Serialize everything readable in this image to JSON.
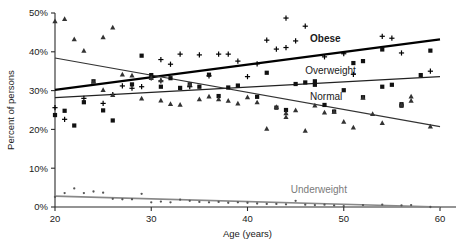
{
  "chart_data": {
    "type": "scatter",
    "title": "",
    "subtitle": "",
    "xlabel": "Age (years)",
    "ylabel": "Percent of persons",
    "xlim": [
      20,
      60
    ],
    "ylim": [
      0,
      50
    ],
    "xticks": [
      20,
      30,
      40,
      50,
      60
    ],
    "xtick_labels": [
      "20",
      "30",
      "40",
      "50",
      "60"
    ],
    "yticks": [
      0,
      10,
      20,
      30,
      40,
      50
    ],
    "ytick_labels": [
      "0%",
      "10%",
      "20%",
      "30%",
      "40%",
      "50%"
    ],
    "grid": false,
    "legend_position": "inline-annotations",
    "series": [
      {
        "name": "Obese",
        "label": "Obese",
        "marker": "plus",
        "color": "#000000",
        "line_color": "#000000",
        "line_width": 2.2,
        "label_x": 46.5,
        "label_y": 42.4,
        "trend": {
          "x": [
            20,
            60
          ],
          "y": [
            30.2,
            43.2
          ]
        },
        "points": [
          {
            "x": 20,
            "y": 25.6
          },
          {
            "x": 21,
            "y": 22.6
          },
          {
            "x": 23,
            "y": 28.0
          },
          {
            "x": 25,
            "y": 26.7
          },
          {
            "x": 26,
            "y": 29.0
          },
          {
            "x": 27,
            "y": 31.2
          },
          {
            "x": 28,
            "y": 30.6
          },
          {
            "x": 29,
            "y": 31.0
          },
          {
            "x": 30,
            "y": 33.3
          },
          {
            "x": 31,
            "y": 38.0
          },
          {
            "x": 31,
            "y": 32.5
          },
          {
            "x": 32,
            "y": 36.8
          },
          {
            "x": 33,
            "y": 39.4
          },
          {
            "x": 34,
            "y": 31.0
          },
          {
            "x": 35,
            "y": 39.2
          },
          {
            "x": 36,
            "y": 33.8
          },
          {
            "x": 37,
            "y": 39.4
          },
          {
            "x": 38,
            "y": 39.4
          },
          {
            "x": 39,
            "y": 37.6
          },
          {
            "x": 40,
            "y": 33.6
          },
          {
            "x": 41,
            "y": 36.9
          },
          {
            "x": 42,
            "y": 43.0
          },
          {
            "x": 43,
            "y": 40.7
          },
          {
            "x": 44,
            "y": 48.7
          },
          {
            "x": 44,
            "y": 41.1
          },
          {
            "x": 45,
            "y": 42.8
          },
          {
            "x": 46,
            "y": 46.6
          },
          {
            "x": 48,
            "y": 38.7
          },
          {
            "x": 50,
            "y": 39.5
          },
          {
            "x": 51,
            "y": 34.2
          },
          {
            "x": 54,
            "y": 44.0
          },
          {
            "x": 55,
            "y": 43.5
          },
          {
            "x": 56,
            "y": 39.7
          },
          {
            "x": 59,
            "y": 35.0
          }
        ]
      },
      {
        "name": "Overweight",
        "label": "Overweight",
        "marker": "square",
        "color": "#111111",
        "line_color": "#222222",
        "line_width": 1.4,
        "label_x": 46.0,
        "label_y": 34.3,
        "trend": {
          "x": [
            20,
            60
          ],
          "y": [
            28.2,
            33.6
          ]
        },
        "points": [
          {
            "x": 20,
            "y": 23.7
          },
          {
            "x": 21,
            "y": 24.8
          },
          {
            "x": 22,
            "y": 21.0
          },
          {
            "x": 23,
            "y": 27.0
          },
          {
            "x": 24,
            "y": 32.4
          },
          {
            "x": 25,
            "y": 24.9
          },
          {
            "x": 26,
            "y": 22.3
          },
          {
            "x": 28,
            "y": 31.6
          },
          {
            "x": 29,
            "y": 39.0
          },
          {
            "x": 30,
            "y": 34.0
          },
          {
            "x": 31,
            "y": 31.0
          },
          {
            "x": 32,
            "y": 33.2
          },
          {
            "x": 33,
            "y": 30.7
          },
          {
            "x": 34,
            "y": 31.6
          },
          {
            "x": 35,
            "y": 31.0
          },
          {
            "x": 36,
            "y": 34.1
          },
          {
            "x": 37,
            "y": 28.6
          },
          {
            "x": 38,
            "y": 30.8
          },
          {
            "x": 39,
            "y": 31.3
          },
          {
            "x": 41,
            "y": 28.4
          },
          {
            "x": 42,
            "y": 34.6
          },
          {
            "x": 43,
            "y": 25.6
          },
          {
            "x": 44,
            "y": 25.0
          },
          {
            "x": 45,
            "y": 31.7
          },
          {
            "x": 46,
            "y": 32.1
          },
          {
            "x": 47,
            "y": 32.4
          },
          {
            "x": 47,
            "y": 31.5
          },
          {
            "x": 48,
            "y": 26.3
          },
          {
            "x": 49,
            "y": 24.6
          },
          {
            "x": 50,
            "y": 30.1
          },
          {
            "x": 51,
            "y": 37.1
          },
          {
            "x": 52,
            "y": 28.3
          },
          {
            "x": 52,
            "y": 37.6
          },
          {
            "x": 54,
            "y": 40.6
          },
          {
            "x": 54,
            "y": 31.0
          },
          {
            "x": 55,
            "y": 31.5
          },
          {
            "x": 56,
            "y": 26.5
          },
          {
            "x": 56,
            "y": 26.1
          },
          {
            "x": 58,
            "y": 34.0
          },
          {
            "x": 59,
            "y": 40.3
          }
        ]
      },
      {
        "name": "Normal",
        "label": "Normal",
        "marker": "triangle",
        "color": "#333333",
        "line_color": "#333333",
        "line_width": 1.2,
        "label_x": 46.5,
        "label_y": 27.5,
        "trend": {
          "x": [
            20,
            60
          ],
          "y": [
            38.4,
            20.7
          ]
        },
        "points": [
          {
            "x": 20,
            "y": 47.9
          },
          {
            "x": 21,
            "y": 48.5
          },
          {
            "x": 22,
            "y": 43.3
          },
          {
            "x": 23,
            "y": 40.3
          },
          {
            "x": 24,
            "y": 32.3
          },
          {
            "x": 25,
            "y": 43.8
          },
          {
            "x": 25,
            "y": 30.2
          },
          {
            "x": 26,
            "y": 46.3
          },
          {
            "x": 26,
            "y": 28.9
          },
          {
            "x": 27,
            "y": 34.2
          },
          {
            "x": 28,
            "y": 33.9
          },
          {
            "x": 29,
            "y": 28.0
          },
          {
            "x": 30,
            "y": 33.3
          },
          {
            "x": 31,
            "y": 32.7
          },
          {
            "x": 31,
            "y": 27.5
          },
          {
            "x": 32,
            "y": 26.6
          },
          {
            "x": 33,
            "y": 26.4
          },
          {
            "x": 34,
            "y": 31.7
          },
          {
            "x": 35,
            "y": 27.8
          },
          {
            "x": 36,
            "y": 28.5
          },
          {
            "x": 37,
            "y": 27.8
          },
          {
            "x": 38,
            "y": 27.4
          },
          {
            "x": 39,
            "y": 26.7
          },
          {
            "x": 40,
            "y": 28.3
          },
          {
            "x": 41,
            "y": 27.0
          },
          {
            "x": 42,
            "y": 20.2
          },
          {
            "x": 43,
            "y": 25.8
          },
          {
            "x": 44,
            "y": 24.2
          },
          {
            "x": 44,
            "y": 23.2
          },
          {
            "x": 45,
            "y": 25.0
          },
          {
            "x": 46,
            "y": 19.7
          },
          {
            "x": 47,
            "y": 26.2
          },
          {
            "x": 48,
            "y": 24.4
          },
          {
            "x": 49,
            "y": 24.6
          },
          {
            "x": 50,
            "y": 22.0
          },
          {
            "x": 51,
            "y": 20.5
          },
          {
            "x": 52,
            "y": 28.2
          },
          {
            "x": 53,
            "y": 24.0
          },
          {
            "x": 54,
            "y": 21.7
          },
          {
            "x": 56,
            "y": 26.4
          },
          {
            "x": 57,
            "y": 28.5
          },
          {
            "x": 57,
            "y": 27.4
          },
          {
            "x": 59,
            "y": 20.8
          }
        ]
      },
      {
        "name": "Underweight",
        "label": "Underweight",
        "marker": "dot",
        "color": "#555555",
        "line_color": "#888888",
        "line_width": 1.6,
        "label_x": 44.5,
        "label_y": 3.6,
        "trend": {
          "x": [
            20,
            60
          ],
          "y": [
            2.8,
            0.0
          ]
        },
        "points": [
          {
            "x": 20,
            "y": 2.6
          },
          {
            "x": 21,
            "y": 3.6
          },
          {
            "x": 22,
            "y": 4.8
          },
          {
            "x": 23,
            "y": 3.6
          },
          {
            "x": 24,
            "y": 4.0
          },
          {
            "x": 25,
            "y": 3.7
          },
          {
            "x": 26,
            "y": 2.1
          },
          {
            "x": 27,
            "y": 2.0
          },
          {
            "x": 28,
            "y": 2.0
          },
          {
            "x": 29,
            "y": 3.4
          },
          {
            "x": 30,
            "y": 1.2
          },
          {
            "x": 31,
            "y": 1.4
          },
          {
            "x": 32,
            "y": 1.2
          },
          {
            "x": 33,
            "y": 1.9
          },
          {
            "x": 34,
            "y": 1.6
          },
          {
            "x": 35,
            "y": 1.3
          },
          {
            "x": 36,
            "y": 1.2
          },
          {
            "x": 37,
            "y": 1.3
          },
          {
            "x": 38,
            "y": 1.1
          },
          {
            "x": 39,
            "y": 1.2
          },
          {
            "x": 40,
            "y": 1.1
          },
          {
            "x": 41,
            "y": 0.9
          },
          {
            "x": 42,
            "y": 0.8
          },
          {
            "x": 43,
            "y": 0.8
          },
          {
            "x": 44,
            "y": 0.7
          },
          {
            "x": 45,
            "y": 1.6
          },
          {
            "x": 46,
            "y": 0.6
          },
          {
            "x": 47,
            "y": 0.5
          },
          {
            "x": 48,
            "y": 0.6
          },
          {
            "x": 49,
            "y": 0.4
          },
          {
            "x": 50,
            "y": 0.2
          },
          {
            "x": 52,
            "y": 0.5
          },
          {
            "x": 54,
            "y": 0.6
          },
          {
            "x": 56,
            "y": 0.4
          },
          {
            "x": 57,
            "y": 0.5
          },
          {
            "x": 59,
            "y": 0.0
          }
        ]
      }
    ]
  }
}
